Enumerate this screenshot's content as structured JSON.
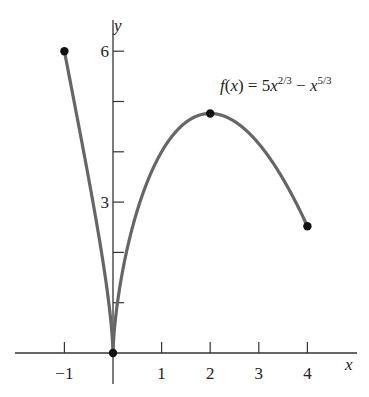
{
  "chart_data": {
    "type": "line",
    "title": "",
    "function_label": "f(x) = 5x^{2/3} − x^{5/3}",
    "function_label_parts": {
      "lhs": "f(x) = 5x",
      "exp1": "2/3",
      "mid": " − x",
      "exp2": "5/3"
    },
    "xlabel": "x",
    "ylabel": "y",
    "xlim": [
      -1.9,
      4.8
    ],
    "ylim": [
      0,
      7
    ],
    "x_ticks": [
      -1,
      1,
      2,
      3,
      4
    ],
    "x_tick_labels": [
      "−1",
      "1",
      "2",
      "3",
      "4"
    ],
    "y_ticks": [
      1,
      2,
      3,
      4,
      5,
      6
    ],
    "y_tick_labels": [
      "",
      "",
      "3",
      "",
      "",
      "6"
    ],
    "grid": false,
    "domain": [
      -1,
      4
    ],
    "marked_points": [
      {
        "x": -1,
        "y": 6
      },
      {
        "x": 0,
        "y": 0
      },
      {
        "x": 2,
        "y": 4.76
      },
      {
        "x": 4,
        "y": 2.52
      }
    ],
    "series": [
      {
        "name": "f(x)",
        "x": [
          -1,
          -0.5,
          -0.1,
          0,
          0.1,
          0.25,
          0.5,
          1,
          1.5,
          2,
          2.5,
          3,
          3.5,
          4
        ],
        "values": [
          6,
          3.46,
          1.12,
          0,
          1.06,
          1.92,
          2.83,
          4,
          4.58,
          4.76,
          4.63,
          4.16,
          3.45,
          2.52
        ]
      }
    ]
  },
  "labels": {
    "x_axis": "x",
    "y_axis": "y"
  }
}
